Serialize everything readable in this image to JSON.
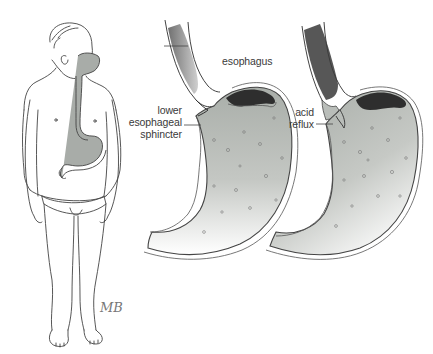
{
  "figure": {
    "panels": [
      {
        "id": "body",
        "description": "Figure of a person showing esophagus and stomach"
      },
      {
        "id": "normal",
        "description": "Normal stomach with closed lower esophageal sphincter"
      },
      {
        "id": "reflux",
        "description": "Stomach with acid reflux through sphincter"
      }
    ],
    "labels": {
      "esophagus": "esophagus",
      "sphincter_line1": "lower",
      "sphincter_line2": "esophageal",
      "sphincter_line3": "sphincter",
      "reflux_line1": "acid",
      "reflux_line2": "reflux"
    },
    "signature": "MB",
    "colors": {
      "outline": "#3a3a3a",
      "stomach_fill": "#b9bdb9",
      "organ_fill": "#9ea39f",
      "dark_mucosa": "#2e2e2e",
      "background": "#ffffff"
    }
  }
}
